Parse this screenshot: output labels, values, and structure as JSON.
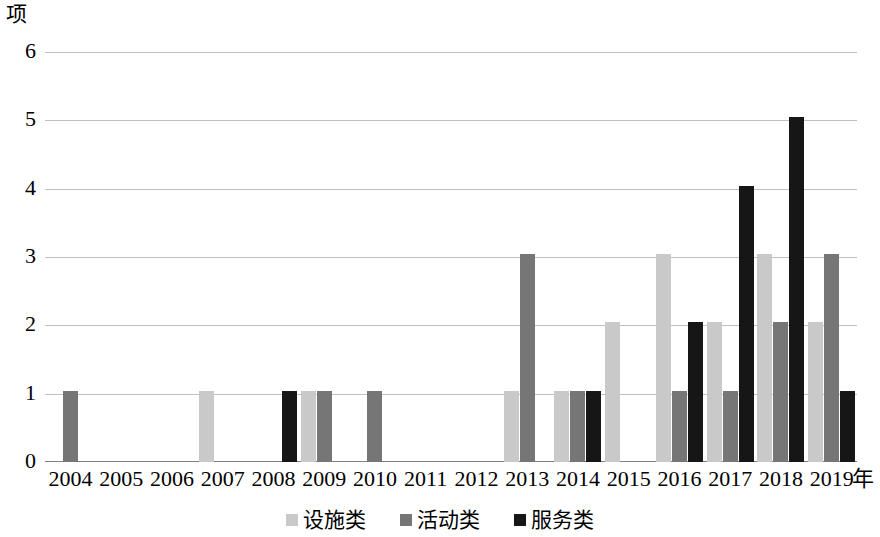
{
  "chart_data": {
    "type": "bar",
    "title": "",
    "xlabel": "年",
    "ylabel": "项",
    "ylim": [
      0,
      6
    ],
    "yticks": [
      0,
      1,
      2,
      3,
      4,
      5,
      6
    ],
    "grid": true,
    "legend_position": "bottom",
    "categories": [
      "2004",
      "2005",
      "2006",
      "2007",
      "2008",
      "2009",
      "2010",
      "2011",
      "2012",
      "2013",
      "2014",
      "2015",
      "2016",
      "2017",
      "2018",
      "2019"
    ],
    "series": [
      {
        "name": "设施类",
        "color": "#c9c9c9",
        "values": [
          0,
          0,
          0,
          1,
          0,
          1,
          0,
          0,
          0,
          1,
          1,
          2,
          3,
          2,
          3,
          2
        ]
      },
      {
        "name": "活动类",
        "color": "#767676",
        "values": [
          1,
          0,
          0,
          0,
          0,
          1,
          1,
          0,
          0,
          3,
          1,
          0,
          1,
          1,
          2,
          3
        ]
      },
      {
        "name": "服务类",
        "color": "#161616",
        "values": [
          0,
          0,
          0,
          0,
          1,
          0,
          0,
          0,
          0,
          0,
          1,
          0,
          2,
          4,
          5,
          1
        ]
      }
    ]
  }
}
